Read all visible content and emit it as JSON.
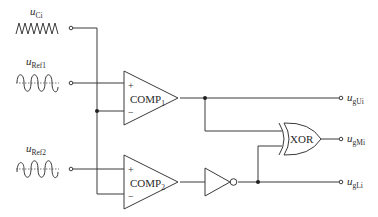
{
  "diagram": {
    "type": "circuit-schematic",
    "inputs": [
      {
        "id": "uCi",
        "symbol": "u",
        "subscript": "Ci",
        "waveform": "triangle-carrier"
      },
      {
        "id": "uRef1",
        "symbol": "u",
        "subscript": "Ref1",
        "waveform": "sine"
      },
      {
        "id": "uRef2",
        "symbol": "u",
        "subscript": "Ref2",
        "waveform": "sine"
      }
    ],
    "comparators": [
      {
        "id": "comp1",
        "name": "COMP",
        "subscript": "1",
        "plus": "+",
        "minus": "−"
      },
      {
        "id": "comp2",
        "name": "COMP",
        "subscript": "2",
        "plus": "+",
        "minus": "−"
      }
    ],
    "gates": {
      "inverter": {
        "id": "not1",
        "label": ""
      },
      "xor": {
        "id": "xor1",
        "label": "XOR"
      }
    },
    "outputs": [
      {
        "id": "ugUi",
        "symbol": "u",
        "subscript": "gUi"
      },
      {
        "id": "ugMi",
        "symbol": "u",
        "subscript": "gMi"
      },
      {
        "id": "ugLi",
        "symbol": "u",
        "subscript": "gLi"
      }
    ],
    "colors": {
      "line": "#3a3a3a",
      "text": "#2a2a2a",
      "background": "#ffffff"
    }
  }
}
